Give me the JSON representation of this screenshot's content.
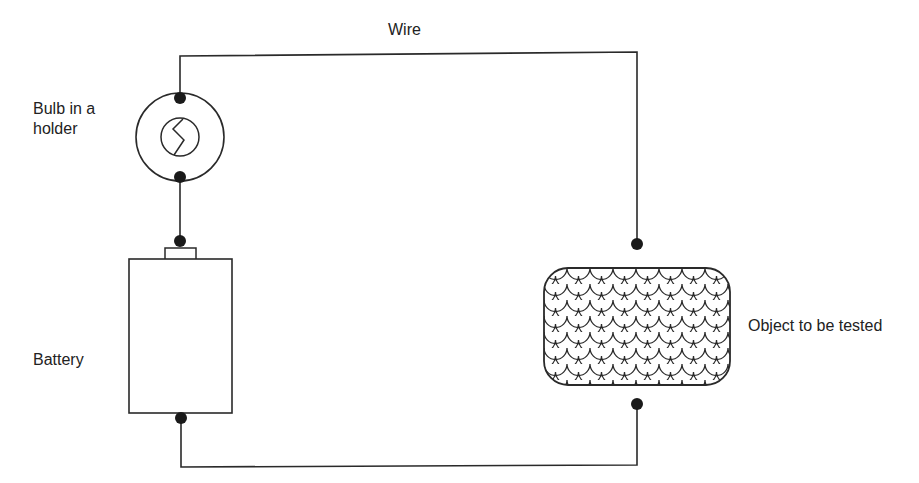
{
  "diagram": {
    "type": "electric circuit for testing conductivity",
    "labels": {
      "wire": "Wire",
      "bulb": "Bulb in a holder",
      "battery": "Battery",
      "object": "Object to be tested"
    },
    "components": [
      {
        "id": "bulb",
        "name": "Bulb in a holder",
        "shape": "circle with inner filament circle",
        "terminals": 2
      },
      {
        "id": "battery",
        "name": "Battery",
        "shape": "rectangle with top cap",
        "terminals": 2
      },
      {
        "id": "object",
        "name": "Object to be tested",
        "shape": "rounded rectangle with scale pattern",
        "terminals": 2
      },
      {
        "id": "wire",
        "name": "Wire",
        "connects": [
          "bulb-top",
          "object-top",
          "battery-bottom",
          "object-bottom",
          "bulb-bottom",
          "battery-top"
        ]
      }
    ],
    "colors": {
      "line": "#2a2a2a",
      "terminal": "#1a1a1a",
      "background": "#ffffff"
    }
  }
}
